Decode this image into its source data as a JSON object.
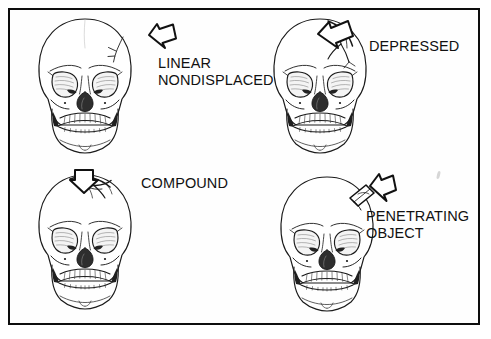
{
  "figure": {
    "title_alt": "Types of skull fractures",
    "border_color": "#0d0d0d",
    "background_color": "#ffffff",
    "ink_color": "#111111"
  },
  "panels": [
    {
      "id": "linear-nondisplaced",
      "label_lines": [
        "LINEAR",
        "NONDISPLACED"
      ],
      "label_text": "LINEAR\nNONDISPLACED",
      "arrow_name": "impact-arrow-down-left",
      "injury_marking": "thin linear crack on right parietal region"
    },
    {
      "id": "depressed",
      "label_lines": [
        "DEPRESSED"
      ],
      "label_text": "DEPRESSED",
      "arrow_name": "impact-arrow-down-left",
      "injury_marking": "stellate depressed area with radiating cracks at vertex"
    },
    {
      "id": "compound",
      "label_lines": [
        "COMPOUND"
      ],
      "label_text": "COMPOUND",
      "arrow_name": "impact-arrow-down",
      "injury_marking": "open wound flap at top of cranium"
    },
    {
      "id": "penetrating-object",
      "label_lines": [
        "PENETRATING",
        "OBJECT"
      ],
      "label_text": "PENETRATING\nOBJECT",
      "arrow_name": "impact-arrow-down-left",
      "injury_marking": "elongated object piercing the skull"
    }
  ]
}
